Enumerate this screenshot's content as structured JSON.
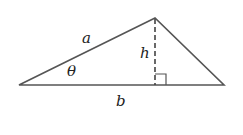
{
  "diagram": {
    "type": "triangle-area",
    "vertices": {
      "left": [
        19,
        85
      ],
      "top": [
        155,
        18
      ],
      "right": [
        224,
        85
      ]
    },
    "labels": {
      "side_a": "a",
      "height": "h",
      "angle": "θ",
      "base": "b"
    },
    "colors": {
      "stroke": "#555555",
      "text": "#222222",
      "background": "#ffffff"
    }
  }
}
